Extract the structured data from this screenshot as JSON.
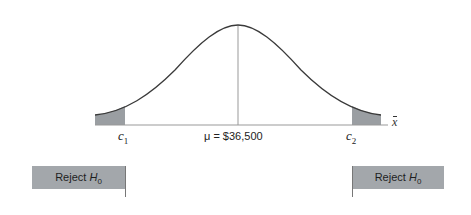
{
  "diagram": {
    "type": "normal-distribution-two-tailed-test",
    "mean_label": "μ = $36,500",
    "axis_label": "x",
    "critical_values": [
      {
        "name": "c",
        "sub": "1"
      },
      {
        "name": "c",
        "sub": "2"
      }
    ],
    "rejection_regions": [
      {
        "label": "Reject ",
        "h": "H",
        "sub": "0",
        "side": "left"
      },
      {
        "label": "Reject ",
        "h": "H",
        "sub": "0",
        "side": "right"
      }
    ],
    "colors": {
      "curve": "#3a3a3a",
      "shade": "#9a9ea2",
      "reject_box": "#a3a7ab"
    }
  }
}
